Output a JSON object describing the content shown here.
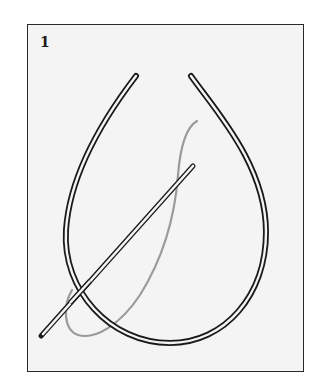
{
  "figure": {
    "step_number": "1",
    "elements": [
      {
        "name": "loop-of-cord",
        "description": "Teardrop-shaped loop of cord with open ends at top"
      },
      {
        "name": "needle",
        "description": "Long needle crossing the loop diagonally"
      },
      {
        "name": "thread",
        "description": "Gray thread passing through needle eye forming a loop"
      }
    ]
  },
  "colors": {
    "frame": "#2a2a2a",
    "background": "#f4f4f4",
    "cord": "#1a1a1a",
    "thread": "#9a9a9a"
  }
}
